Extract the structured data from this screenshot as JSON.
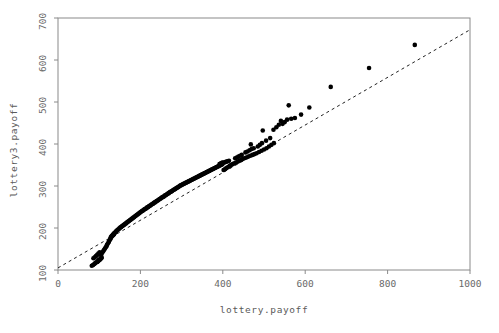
{
  "chart_data": {
    "type": "scatter",
    "title": "",
    "subtitle": "",
    "xlabel": "lottery.payoff",
    "ylabel": "lottery3.payoff",
    "xlim": [
      0,
      1000
    ],
    "ylim": [
      100,
      700
    ],
    "xticks": [
      0,
      200,
      400,
      600,
      800,
      1000
    ],
    "yticks": [
      100,
      200,
      300,
      400,
      500,
      600,
      700
    ],
    "xtick_labels": [
      "0",
      "200",
      "400",
      "600",
      "800",
      "1000"
    ],
    "ytick_labels": [
      "100",
      "200",
      "300",
      "400",
      "500",
      "600",
      "700"
    ],
    "grid": false,
    "legend": null,
    "legend_position": "none",
    "marker": {
      "shape": "circle",
      "color": "#000000",
      "size": 2.3
    },
    "reference_line": {
      "style": "dashed",
      "color": "#222222",
      "x": [
        0,
        1000
      ],
      "y": [
        105,
        672
      ],
      "note": "dashed straight reference line through quantile pairs"
    },
    "series": [
      {
        "name": "quantile pairs",
        "points": [
          [
            82,
            110
          ],
          [
            85,
            112
          ],
          [
            88,
            114
          ],
          [
            90,
            116
          ],
          [
            92,
            118
          ],
          [
            95,
            119
          ],
          [
            97,
            121
          ],
          [
            99,
            123
          ],
          [
            101,
            124
          ],
          [
            103,
            126
          ],
          [
            105,
            128
          ],
          [
            106,
            130
          ],
          [
            104,
            136
          ],
          [
            106,
            139
          ],
          [
            108,
            142
          ],
          [
            110,
            145
          ],
          [
            112,
            148
          ],
          [
            114,
            151
          ],
          [
            116,
            154
          ],
          [
            118,
            157
          ],
          [
            119,
            160
          ],
          [
            121,
            163
          ],
          [
            123,
            166
          ],
          [
            124,
            169
          ],
          [
            126,
            172
          ],
          [
            128,
            175
          ],
          [
            129,
            178
          ],
          [
            131,
            181
          ],
          [
            133,
            184
          ],
          [
            135,
            186
          ],
          [
            137,
            188
          ],
          [
            139,
            190
          ],
          [
            141,
            192
          ],
          [
            143,
            194
          ],
          [
            145,
            196
          ],
          [
            147,
            197
          ],
          [
            149,
            199
          ],
          [
            151,
            201
          ],
          [
            153,
            202
          ],
          [
            155,
            204
          ],
          [
            157,
            205
          ],
          [
            159,
            207
          ],
          [
            161,
            208
          ],
          [
            163,
            210
          ],
          [
            165,
            211
          ],
          [
            167,
            213
          ],
          [
            169,
            214
          ],
          [
            171,
            216
          ],
          [
            173,
            217
          ],
          [
            175,
            219
          ],
          [
            177,
            220
          ],
          [
            179,
            222
          ],
          [
            181,
            223
          ],
          [
            183,
            225
          ],
          [
            185,
            226
          ],
          [
            187,
            228
          ],
          [
            189,
            229
          ],
          [
            191,
            231
          ],
          [
            193,
            232
          ],
          [
            195,
            234
          ],
          [
            197,
            235
          ],
          [
            199,
            237
          ],
          [
            201,
            238
          ],
          [
            203,
            240
          ],
          [
            205,
            241
          ],
          [
            207,
            242
          ],
          [
            209,
            244
          ],
          [
            211,
            245
          ],
          [
            213,
            246
          ],
          [
            215,
            248
          ],
          [
            217,
            249
          ],
          [
            219,
            250
          ],
          [
            221,
            252
          ],
          [
            223,
            253
          ],
          [
            225,
            254
          ],
          [
            227,
            256
          ],
          [
            229,
            257
          ],
          [
            231,
            258
          ],
          [
            233,
            260
          ],
          [
            235,
            261
          ],
          [
            237,
            262
          ],
          [
            239,
            264
          ],
          [
            241,
            265
          ],
          [
            243,
            266
          ],
          [
            245,
            268
          ],
          [
            247,
            269
          ],
          [
            249,
            270
          ],
          [
            251,
            272
          ],
          [
            253,
            273
          ],
          [
            255,
            274
          ],
          [
            257,
            275
          ],
          [
            259,
            277
          ],
          [
            261,
            278
          ],
          [
            263,
            279
          ],
          [
            265,
            281
          ],
          [
            267,
            282
          ],
          [
            269,
            283
          ],
          [
            271,
            285
          ],
          [
            273,
            286
          ],
          [
            275,
            287
          ],
          [
            277,
            288
          ],
          [
            279,
            290
          ],
          [
            281,
            291
          ],
          [
            283,
            292
          ],
          [
            285,
            293
          ],
          [
            287,
            295
          ],
          [
            289,
            296
          ],
          [
            291,
            297
          ],
          [
            293,
            298
          ],
          [
            295,
            300
          ],
          [
            297,
            301
          ],
          [
            299,
            302
          ],
          [
            301,
            303
          ],
          [
            303,
            304
          ],
          [
            305,
            305
          ],
          [
            307,
            306
          ],
          [
            309,
            307
          ],
          [
            311,
            308
          ],
          [
            313,
            309
          ],
          [
            315,
            310
          ],
          [
            317,
            311
          ],
          [
            319,
            312
          ],
          [
            321,
            313
          ],
          [
            323,
            314
          ],
          [
            325,
            315
          ],
          [
            327,
            316
          ],
          [
            329,
            317
          ],
          [
            331,
            318
          ],
          [
            333,
            319
          ],
          [
            335,
            320
          ],
          [
            337,
            321
          ],
          [
            339,
            322
          ],
          [
            341,
            323
          ],
          [
            343,
            324
          ],
          [
            345,
            325
          ],
          [
            347,
            326
          ],
          [
            349,
            327
          ],
          [
            351,
            328
          ],
          [
            353,
            329
          ],
          [
            355,
            330
          ],
          [
            357,
            331
          ],
          [
            359,
            332
          ],
          [
            361,
            333
          ],
          [
            363,
            334
          ],
          [
            365,
            335
          ],
          [
            367,
            336
          ],
          [
            369,
            337
          ],
          [
            371,
            338
          ],
          [
            373,
            339
          ],
          [
            375,
            340
          ],
          [
            377,
            341
          ],
          [
            379,
            342
          ],
          [
            381,
            343
          ],
          [
            383,
            344
          ],
          [
            385,
            345
          ],
          [
            387,
            346
          ],
          [
            389,
            347
          ],
          [
            391,
            348
          ],
          [
            393,
            349
          ],
          [
            395,
            350
          ],
          [
            397,
            351
          ],
          [
            399,
            352
          ],
          [
            402,
            338
          ],
          [
            405,
            340
          ],
          [
            408,
            342
          ],
          [
            411,
            344
          ],
          [
            414,
            346
          ],
          [
            417,
            348
          ],
          [
            420,
            350
          ],
          [
            424,
            352
          ],
          [
            428,
            354
          ],
          [
            432,
            356
          ],
          [
            436,
            358
          ],
          [
            440,
            360
          ],
          [
            444,
            362
          ],
          [
            448,
            364
          ],
          [
            452,
            366
          ],
          [
            457,
            368
          ],
          [
            462,
            370
          ],
          [
            467,
            372
          ],
          [
            472,
            374
          ],
          [
            477,
            376
          ],
          [
            482,
            378
          ],
          [
            488,
            381
          ],
          [
            494,
            384
          ],
          [
            500,
            387
          ],
          [
            506,
            390
          ],
          [
            512,
            394
          ],
          [
            518,
            398
          ],
          [
            524,
            402
          ],
          [
            468,
            399
          ],
          [
            497,
            432
          ],
          [
            523,
            434
          ],
          [
            541,
            455
          ],
          [
            556,
            458
          ],
          [
            560,
            492
          ],
          [
            575,
            462
          ],
          [
            590,
            470
          ],
          [
            610,
            487
          ],
          [
            662,
            536
          ],
          [
            755,
            581
          ],
          [
            866,
            636
          ],
          [
            86,
            128
          ],
          [
            89,
            130
          ],
          [
            92,
            133
          ],
          [
            95,
            136
          ],
          [
            98,
            139
          ],
          [
            101,
            142
          ],
          [
            96,
            120
          ],
          [
            98,
            122
          ],
          [
            100,
            125
          ],
          [
            128,
            178
          ],
          [
            130,
            180
          ],
          [
            132,
            182
          ],
          [
            134,
            183
          ],
          [
            136,
            185
          ],
          [
            392,
            352
          ],
          [
            394,
            353
          ],
          [
            396,
            354
          ],
          [
            398,
            355
          ],
          [
            400,
            356
          ],
          [
            404,
            356
          ],
          [
            406,
            357
          ],
          [
            409,
            358
          ],
          [
            412,
            359
          ],
          [
            415,
            360
          ],
          [
            430,
            366
          ],
          [
            434,
            368
          ],
          [
            438,
            370
          ],
          [
            442,
            372
          ],
          [
            446,
            374
          ],
          [
            455,
            380
          ],
          [
            460,
            382
          ],
          [
            465,
            385
          ],
          [
            470,
            388
          ],
          [
            475,
            390
          ],
          [
            485,
            394
          ],
          [
            490,
            398
          ],
          [
            495,
            402
          ],
          [
            505,
            408
          ],
          [
            515,
            414
          ],
          [
            530,
            440
          ],
          [
            536,
            446
          ],
          [
            545,
            448
          ],
          [
            550,
            452
          ],
          [
            566,
            460
          ]
        ]
      }
    ],
    "outliers": [
      [
        468,
        399
      ],
      [
        497,
        432
      ],
      [
        523,
        434
      ],
      [
        541,
        455
      ],
      [
        556,
        458
      ],
      [
        560,
        492
      ],
      [
        610,
        487
      ],
      [
        662,
        536
      ],
      [
        755,
        581
      ],
      [
        866,
        636
      ]
    ]
  },
  "figure": {
    "background_color": "#ffffff",
    "axis_color": "#8a8a8a",
    "point_color": "#000000",
    "line_color": "#222222"
  }
}
